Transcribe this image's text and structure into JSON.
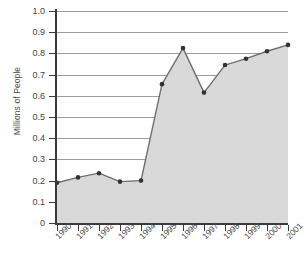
{
  "chart_data": {
    "type": "area",
    "title": "",
    "xlabel": "",
    "ylabel": "Millions of People",
    "categories": [
      "1990",
      "1991",
      "1992",
      "1993",
      "1994",
      "1995",
      "1996",
      "1997",
      "1998",
      "1999",
      "2000",
      "2001"
    ],
    "values": [
      0.19,
      0.215,
      0.235,
      0.195,
      0.2,
      0.655,
      0.825,
      0.615,
      0.745,
      0.775,
      0.81,
      0.84
    ],
    "series": [
      {
        "name": "Millions of People",
        "values": [
          0.19,
          0.215,
          0.235,
          0.195,
          0.2,
          0.655,
          0.825,
          0.615,
          0.745,
          0.775,
          0.81,
          0.84
        ]
      }
    ],
    "ylim": [
      0,
      1.0
    ],
    "ytick_labels": [
      "0",
      "0.1",
      "0.2",
      "0.3",
      "0.4",
      "0.5",
      "0.6",
      "0.7",
      "0.8",
      "0.9",
      "1.0"
    ],
    "ytick_values": [
      0,
      0.1,
      0.2,
      0.3,
      0.4,
      0.5,
      0.6,
      0.7,
      0.8,
      0.9,
      1.0
    ],
    "grid": true,
    "legend": "none",
    "colors": {
      "fill": "#d9d9d9",
      "line": "#6e6e6e",
      "marker": "#333333",
      "grid": "#9c9c9c",
      "axis": "#3a3a3a",
      "text": "#4a4a4a",
      "background": "#ffffff"
    }
  }
}
